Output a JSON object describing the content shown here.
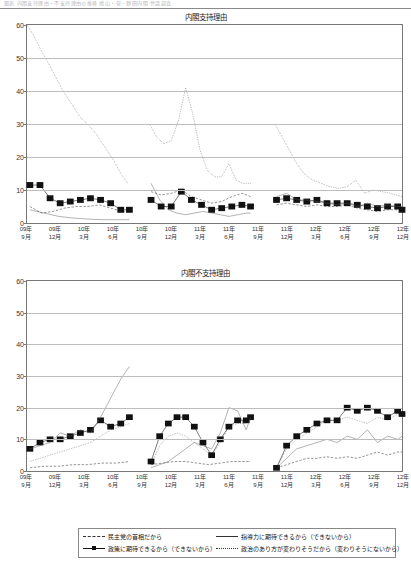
{
  "header": {
    "faded_text": "図表  内閣支持理由・不支持理由の推移  鳩山・菅・野田内閣  世論調査"
  },
  "legend": {
    "items": [
      {
        "label": "民主党の首相だから",
        "style": "dashed"
      },
      {
        "label": "指導力に期待できるから（できないから）",
        "style": "solid"
      },
      {
        "label": "政策に期待できるから（できないから）",
        "style": "square-line"
      },
      {
        "label": "政治のあり方が変わりそうだから（変わりそうにないから）",
        "style": "dotted"
      }
    ]
  },
  "x_labels": [
    {
      "year": "09年",
      "month": "9月"
    },
    {
      "year": "09年",
      "month": "12月"
    },
    {
      "year": "10年",
      "month": "3月"
    },
    {
      "year": "10年",
      "month": "6月"
    },
    {
      "year": "10年",
      "month": "9月"
    },
    {
      "year": "10年",
      "month": "12月"
    },
    {
      "year": "11年",
      "month": "3月"
    },
    {
      "year": "11年",
      "month": "6月"
    },
    {
      "year": "11年",
      "month": "9月"
    },
    {
      "year": "11年",
      "month": "12月"
    },
    {
      "year": "12年",
      "month": "3月"
    },
    {
      "year": "12年",
      "month": "6月"
    },
    {
      "year": "12年",
      "month": "9月"
    },
    {
      "year": "12年",
      "month": "12月"
    }
  ],
  "chart_data": [
    {
      "type": "line",
      "title": "内閣支持理由",
      "xlabel": "",
      "ylabel": "",
      "ylim": [
        0,
        60
      ],
      "yticks": [
        0,
        10,
        20,
        30,
        40,
        50,
        60
      ],
      "grid": true,
      "legend_position": "below-figure",
      "x": [
        0,
        1,
        2,
        3,
        4,
        5,
        6,
        7,
        8,
        9,
        10,
        11,
        12,
        13
      ],
      "series": [
        {
          "name": "民主党の首相だから",
          "style": "dotted",
          "segments": [
            {
              "x": [
                0.0,
                0.22,
                0.45,
                0.7,
                0.95,
                1.25,
                1.55,
                1.85,
                2.1,
                2.4,
                2.7,
                3.0,
                3.25,
                3.5
              ],
              "y": [
                60,
                57,
                53,
                49,
                45,
                40,
                36,
                32,
                30,
                27,
                23,
                19,
                15,
                12
              ]
            },
            {
              "x": [
                4.25,
                4.5,
                4.75,
                5.0,
                5.25,
                5.5,
                5.75,
                6.0,
                6.25,
                6.5,
                6.75,
                7.0,
                7.25,
                7.5,
                7.75
              ],
              "y": [
                30,
                26,
                24,
                25,
                31,
                41,
                33,
                22,
                16,
                14,
                14,
                18,
                13,
                12,
                12
              ]
            },
            {
              "x": [
                8.6,
                8.85,
                9.1,
                9.35,
                9.6,
                9.9,
                10.2,
                10.5,
                10.8,
                11.1,
                11.4,
                11.7,
                12.0,
                12.3,
                12.6,
                13.0
              ],
              "y": [
                30,
                26,
                22,
                18,
                15,
                13,
                12,
                11,
                10.5,
                11,
                13,
                9,
                10,
                9.5,
                9,
                8
              ]
            }
          ]
        },
        {
          "name": "政策に期待できるから（できないから）",
          "style": "square-line",
          "segments": [
            {
              "x": [
                0.1,
                0.45,
                0.8,
                1.15,
                1.5,
                1.85,
                2.2,
                2.55,
                2.9,
                3.25,
                3.55
              ],
              "y": [
                11.5,
                11.5,
                7.5,
                6,
                6.5,
                7,
                7.5,
                7,
                6,
                4,
                4
              ]
            },
            {
              "x": [
                4.3,
                4.65,
                5.0,
                5.35,
                5.7,
                6.05,
                6.4,
                6.75,
                7.1,
                7.45,
                7.75
              ],
              "y": [
                7,
                5,
                5,
                9.5,
                7,
                5.5,
                4,
                4.5,
                5,
                5.5,
                5
              ]
            },
            {
              "x": [
                8.65,
                9.0,
                9.35,
                9.7,
                10.05,
                10.4,
                10.75,
                11.1,
                11.45,
                11.8,
                12.15,
                12.5,
                12.85,
                13.0
              ],
              "y": [
                7,
                7.5,
                7,
                6.5,
                7,
                6,
                6,
                6,
                5.5,
                5,
                4.5,
                5,
                5,
                4
              ]
            }
          ]
        },
        {
          "name": "指導力に期待できるから（できないから）",
          "style": "solid",
          "segments": [
            {
              "x": [
                0.1,
                0.6,
                1.1,
                1.6,
                2.1,
                2.6,
                3.1,
                3.55
              ],
              "y": [
                4,
                3,
                2,
                1.5,
                1.2,
                1.0,
                1.0,
                1.0
              ]
            },
            {
              "x": [
                4.3,
                4.6,
                4.9,
                5.2,
                5.5,
                5.8,
                6.1,
                6.4,
                6.7,
                7.0,
                7.3,
                7.6,
                7.75
              ],
              "y": [
                12,
                7,
                4,
                3,
                2.5,
                3,
                3.5,
                3,
                2.5,
                2,
                2.5,
                3,
                3
              ]
            },
            {
              "x": [
                8.65,
                9.0,
                9.35,
                9.7,
                10.05,
                10.4,
                10.75,
                11.1,
                11.45,
                11.8,
                12.15,
                12.5,
                12.85,
                13.0
              ],
              "y": [
                8,
                9,
                7,
                7,
                6.5,
                6,
                5.5,
                6,
                5,
                6,
                5,
                5.5,
                5,
                5
              ]
            }
          ]
        },
        {
          "name": "政治のあり方が変わりそうだから（変わりそうにないから）",
          "style": "dashed",
          "segments": [
            {
              "x": [
                0.1,
                0.5,
                0.9,
                1.3,
                1.7,
                2.1,
                2.5,
                2.9,
                3.3,
                3.55
              ],
              "y": [
                5,
                3,
                3.5,
                4.5,
                5,
                5,
                5.5,
                4.5,
                3.5,
                3.5
              ]
            },
            {
              "x": [
                4.3,
                4.65,
                5.0,
                5.35,
                5.7,
                6.05,
                6.4,
                6.75,
                7.1,
                7.45,
                7.75
              ],
              "y": [
                9.5,
                8.5,
                9,
                10,
                8,
                7,
                6,
                6.5,
                8,
                9,
                8
              ]
            },
            {
              "x": [
                8.65,
                9.0,
                9.35,
                9.7,
                10.05,
                10.4,
                10.75,
                11.1,
                11.45,
                11.8,
                12.15,
                12.5,
                12.85,
                13.0
              ],
              "y": [
                5.5,
                6,
                5.5,
                5,
                5.5,
                5,
                5,
                5.5,
                4.5,
                4,
                3.5,
                4,
                4,
                5
              ]
            }
          ]
        }
      ]
    },
    {
      "type": "line",
      "title": "内閣不支持理由",
      "xlabel": "",
      "ylabel": "",
      "ylim": [
        0,
        60
      ],
      "yticks": [
        0,
        10,
        20,
        30,
        40,
        50,
        60
      ],
      "grid": true,
      "legend_position": "below-figure",
      "x": [
        0,
        1,
        2,
        3,
        4,
        5,
        6,
        7,
        8,
        9,
        10,
        11,
        12,
        13
      ],
      "series": [
        {
          "name": "政策に期待できるから（できないから）",
          "style": "square-line",
          "segments": [
            {
              "x": [
                0.1,
                0.45,
                0.8,
                1.15,
                1.5,
                1.85,
                2.2,
                2.55,
                2.9,
                3.25,
                3.55
              ],
              "y": [
                7,
                9,
                10,
                10,
                11,
                12,
                13,
                16,
                14,
                15,
                17
              ]
            },
            {
              "x": [
                4.3,
                4.6,
                4.9,
                5.2,
                5.5,
                5.8,
                6.1,
                6.4,
                6.7,
                7.0,
                7.3,
                7.6,
                7.75
              ],
              "y": [
                3,
                11,
                15,
                17,
                17,
                14,
                9,
                5,
                10,
                14,
                16,
                16,
                17
              ]
            },
            {
              "x": [
                8.65,
                9.0,
                9.35,
                9.7,
                10.05,
                10.4,
                10.75,
                11.1,
                11.45,
                11.8,
                12.15,
                12.5,
                12.85,
                13.0
              ],
              "y": [
                1,
                8,
                11,
                13,
                15,
                16,
                16,
                20,
                19,
                20,
                19,
                17,
                19,
                18
              ]
            }
          ]
        },
        {
          "name": "指導力に期待できるから（できないから）",
          "style": "solid",
          "segments": [
            {
              "x": [
                0.1,
                0.45,
                0.8,
                1.15,
                1.5,
                1.85,
                2.2,
                2.55,
                2.9,
                3.25,
                3.55
              ],
              "y": [
                7,
                8,
                9,
                12,
                11,
                13,
                12,
                17,
                23,
                29,
                33
              ]
            },
            {
              "x": [
                4.3,
                4.6,
                4.9,
                5.2,
                5.5,
                5.8,
                6.1,
                6.4,
                6.7,
                7.0,
                7.3,
                7.6,
                7.75
              ],
              "y": [
                1,
                2,
                3,
                5,
                7,
                9,
                8,
                7,
                12,
                20,
                19,
                13,
                17
              ]
            },
            {
              "x": [
                8.65,
                9.0,
                9.35,
                9.7,
                10.05,
                10.4,
                10.75,
                11.1,
                11.45,
                11.8,
                12.15,
                12.5,
                12.85,
                13.0
              ],
              "y": [
                1,
                4,
                7,
                8,
                9,
                10,
                9,
                11,
                10,
                13,
                9,
                11,
                10,
                11
              ]
            }
          ]
        },
        {
          "name": "政治のあり方が変わりそうだから（変わりそうにないから）",
          "style": "dotted",
          "segments": [
            {
              "x": [
                0.1,
                0.45,
                0.8,
                1.15,
                1.5,
                1.85,
                2.2,
                2.55,
                2.9,
                3.25,
                3.55
              ],
              "y": [
                3,
                4,
                5,
                6,
                7,
                8,
                9,
                11,
                13,
                14,
                15
              ]
            },
            {
              "x": [
                4.3,
                4.6,
                4.9,
                5.2,
                5.5,
                5.8,
                6.1,
                6.4,
                6.7,
                7.0,
                7.3,
                7.6,
                7.75
              ],
              "y": [
                2,
                8,
                11,
                12,
                11,
                9,
                7,
                5,
                9,
                14,
                15,
                15,
                16
              ]
            },
            {
              "x": [
                8.65,
                9.0,
                9.35,
                9.7,
                10.05,
                10.4,
                10.75,
                11.1,
                11.45,
                11.8,
                12.15,
                12.5,
                12.85,
                13.0
              ],
              "y": [
                1,
                7,
                10,
                12,
                14,
                16,
                16,
                17,
                16,
                15,
                17,
                16,
                18,
                18
              ]
            }
          ]
        },
        {
          "name": "民主党の首相だから",
          "style": "dashed",
          "segments": [
            {
              "x": [
                0.1,
                0.6,
                1.1,
                1.6,
                2.1,
                2.6,
                3.1,
                3.55
              ],
              "y": [
                1,
                1.5,
                1.5,
                2,
                2,
                2.5,
                2.5,
                3
              ]
            },
            {
              "x": [
                4.3,
                4.7,
                5.1,
                5.5,
                5.9,
                6.3,
                6.7,
                7.1,
                7.45,
                7.75
              ],
              "y": [
                2,
                2.5,
                3,
                3,
                2.5,
                2,
                2.5,
                3,
                3,
                3
              ]
            },
            {
              "x": [
                8.65,
                9.0,
                9.35,
                9.7,
                10.05,
                10.4,
                10.75,
                11.1,
                11.45,
                11.8,
                12.15,
                12.5,
                12.85,
                13.0
              ],
              "y": [
                1,
                2,
                3,
                4,
                4,
                4.5,
                4,
                4.5,
                4,
                5,
                6,
                5,
                6,
                6
              ]
            }
          ]
        }
      ]
    }
  ]
}
